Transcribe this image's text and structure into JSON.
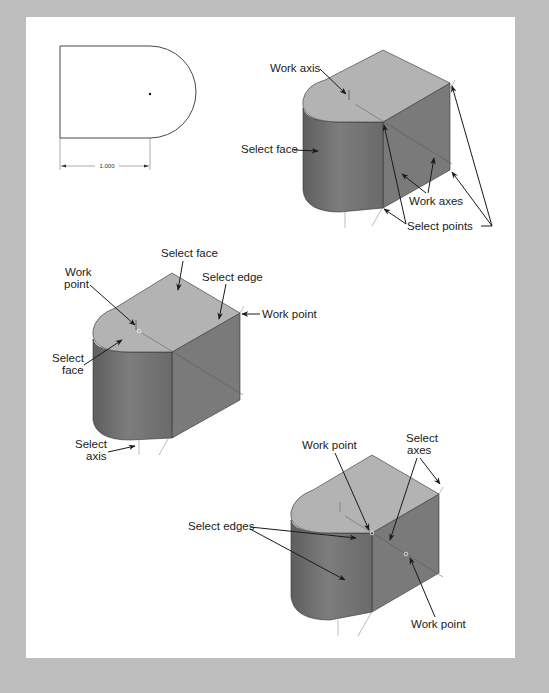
{
  "figure": {
    "background": "#bdbdbd",
    "panel_color": "#ffffff",
    "colors": {
      "top_face": "#b3b3b3",
      "side_face": "#7a7a7a",
      "curved_face": "#6e6e6e",
      "outline": "#222222"
    }
  },
  "sketch": {
    "dimension_value": "1.000"
  },
  "view1": {
    "labels": {
      "work_axis": "Work axis",
      "select_face": "Select face",
      "work_axes": "Work axes",
      "select_points": "Select points"
    }
  },
  "view2": {
    "labels": {
      "select_face_top": "Select face",
      "work_point_1": "Work",
      "work_point_2": "point",
      "select_edge": "Select edge",
      "work_point_right": "Work point",
      "select_face_left_1": "Select",
      "select_face_left_2": "face",
      "select_axis_1": "Select",
      "select_axis_2": "axis"
    }
  },
  "view3": {
    "labels": {
      "work_point_top": "Work point",
      "select_axes_1": "Select",
      "select_axes_2": "axes",
      "select_edges": "Select edges",
      "work_point_bottom": "Work point"
    }
  }
}
